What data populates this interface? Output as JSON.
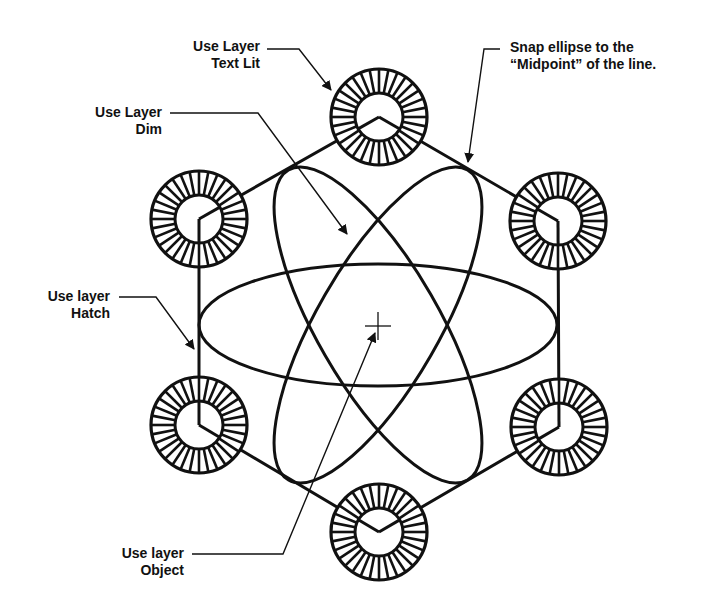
{
  "colors": {
    "ink": "#111111",
    "background": "#ffffff"
  },
  "diagram": {
    "center": {
      "x": 378,
      "y": 325,
      "marker": "crosshair"
    },
    "hexagon_vertices": [
      {
        "id": "top",
        "x": 379,
        "y": 117
      },
      {
        "id": "upper-right",
        "x": 558,
        "y": 221
      },
      {
        "id": "lower-right",
        "x": 559,
        "y": 427
      },
      {
        "id": "bottom",
        "x": 379,
        "y": 532
      },
      {
        "id": "lower-left",
        "x": 199,
        "y": 425
      },
      {
        "id": "upper-left",
        "x": 199,
        "y": 219
      }
    ],
    "wheel": {
      "outer_radius": 48,
      "inner_radius": 24,
      "spoke_count": 32
    },
    "ellipses": [
      {
        "name": "horizontal-ellipse",
        "rx": 179,
        "ry": 61,
        "rotation": 0
      },
      {
        "name": "tilted-ellipse-left",
        "rx": 179,
        "ry": 61,
        "rotation": 60
      },
      {
        "name": "tilted-ellipse-right",
        "rx": 179,
        "ry": 61,
        "rotation": -60
      }
    ]
  },
  "callouts": [
    {
      "name": "callout-text-lit",
      "lines": [
        "Use Layer",
        "Text Lit"
      ]
    },
    {
      "name": "callout-midpoint",
      "lines": [
        "Snap ellipse to the",
        "“Midpoint” of the line."
      ]
    },
    {
      "name": "callout-dim",
      "lines": [
        "Use Layer",
        "Dim"
      ]
    },
    {
      "name": "callout-hatch",
      "lines": [
        "Use layer",
        "Hatch"
      ]
    },
    {
      "name": "callout-object",
      "lines": [
        "Use layer",
        "Object"
      ]
    }
  ]
}
